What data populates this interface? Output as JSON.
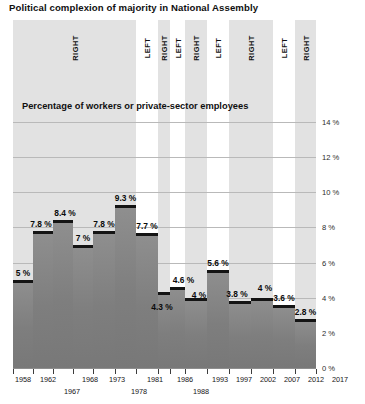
{
  "title": "Political complexion of majority in National Assembly",
  "subtitle": "Percentage of workers or private-sector employees",
  "axis": {
    "y_unit": "%",
    "y_ticks": [
      "0 %",
      "2 %",
      "4 %",
      "6 %",
      "8 %",
      "10 %",
      "12 %",
      "14 %"
    ],
    "y_min": 0,
    "y_max": 14,
    "y_step": 2
  },
  "legend_bands": [
    {
      "label": "RIGHT",
      "start_year": 1958,
      "end_year": 1981,
      "shaded": true
    },
    {
      "label": "LEFT",
      "start_year": 1981,
      "end_year": 1986,
      "shaded": false
    },
    {
      "label": "RIGHT",
      "start_year": 1986,
      "end_year": 1988,
      "shaded": true
    },
    {
      "label": "LEFT",
      "start_year": 1988,
      "end_year": 1993,
      "shaded": false
    },
    {
      "label": "RIGHT",
      "start_year": 1993,
      "end_year": 1997,
      "shaded": true
    },
    {
      "label": "LEFT",
      "start_year": 1997,
      "end_year": 2002,
      "shaded": false
    },
    {
      "label": "RIGHT",
      "start_year": 2002,
      "end_year": 2012,
      "shaded": true
    },
    {
      "label": "LEFT",
      "start_year": 2012,
      "end_year": 2017,
      "shaded": false
    },
    {
      "label": "RIGHT",
      "start_year": 2017,
      "end_year": 2022,
      "shaded": true
    }
  ],
  "x_labels_row1": [
    "1958",
    "1962",
    "1968",
    "1973",
    "1981",
    "1986",
    "1993",
    "1997",
    "2002",
    "2007",
    "2012",
    "2017"
  ],
  "x_labels_row2": [
    "1967",
    "1978",
    "1988"
  ],
  "colors": {
    "band_shaded": "#e2e2e2",
    "band_white": "#ffffff",
    "bar_fill": "#818181",
    "bar_cap": "#141414",
    "gridline": "#b9b9b9",
    "text": "#111111"
  },
  "chart_data": {
    "type": "bar",
    "title": "Political complexion of majority in National Assembly",
    "subtitle": "Percentage of workers or private-sector employees",
    "xlabel": "",
    "ylabel": "Percentage of workers or private-sector employees",
    "ylim": [
      0,
      14
    ],
    "y_tick_values": [
      0,
      2,
      4,
      6,
      8,
      10,
      12,
      14
    ],
    "grid": true,
    "legend_position": "top-inline-bands",
    "categories": [
      "1958",
      "1962",
      "1967",
      "1968",
      "1973",
      "1978",
      "1981",
      "1986",
      "1988",
      "1993",
      "1997",
      "2002",
      "2007",
      "2012",
      "2017"
    ],
    "values": [
      5,
      7.8,
      8.4,
      7,
      7.8,
      9.3,
      7.7,
      4.3,
      4.6,
      4,
      5.6,
      3.8,
      4,
      3.6,
      2.8
    ],
    "data_labels": [
      "5 %",
      "7.8 %",
      "8.4 %",
      "7 %",
      "7.8 %",
      "9.3 %",
      "7.7 %",
      "4.3 %",
      "4.6 %",
      "4 %",
      "5.6 %",
      "3.8 %",
      "4 %",
      "3.6 %",
      "2.8 %"
    ],
    "annotations": [
      {
        "text": "RIGHT",
        "span": "1958-1981"
      },
      {
        "text": "LEFT",
        "span": "1981-1986"
      },
      {
        "text": "RIGHT",
        "span": "1986-1988"
      },
      {
        "text": "LEFT",
        "span": "1988-1993"
      },
      {
        "text": "RIGHT",
        "span": "1993-1997"
      },
      {
        "text": "LEFT",
        "span": "1997-2002"
      },
      {
        "text": "RIGHT",
        "span": "2002-2012"
      },
      {
        "text": "LEFT",
        "span": "2012-2017"
      },
      {
        "text": "RIGHT",
        "span": "2017-"
      }
    ]
  },
  "bars": [
    {
      "year": "1958",
      "label": "5 %",
      "value": 5.0
    },
    {
      "year": "1962",
      "label": "7.8 %",
      "value": 7.8
    },
    {
      "year": "1967",
      "label": "8.4 %",
      "value": 8.4
    },
    {
      "year": "1968",
      "label": "7 %",
      "value": 7.0
    },
    {
      "year": "1973",
      "label": "7.8 %",
      "value": 7.8
    },
    {
      "year": "1978",
      "label": "9.3 %",
      "value": 9.3
    },
    {
      "year": "1981",
      "label": "7.7 %",
      "value": 7.7
    },
    {
      "year": "1986",
      "label": "4.3 %",
      "value": 4.3
    },
    {
      "year": "1988",
      "label": "4.6 %",
      "value": 4.6
    },
    {
      "year": "1993",
      "label": "4 %",
      "value": 4.0
    },
    {
      "year": "1997",
      "label": "5.6 %",
      "value": 5.6
    },
    {
      "year": "2002",
      "label": "3.8 %",
      "value": 3.8
    },
    {
      "year": "2007",
      "label": "4 %",
      "value": 4.0
    },
    {
      "year": "2012",
      "label": "3.6 %",
      "value": 3.6
    },
    {
      "year": "2017",
      "label": "2.8 %",
      "value": 2.8
    }
  ]
}
